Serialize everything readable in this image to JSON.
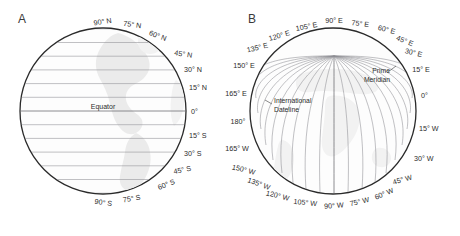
{
  "figure": {
    "panel_a_letter": "A",
    "panel_b_letter": "B",
    "background_color": "#ffffff",
    "outline_color": "#2a2a2a",
    "grid_color": "#8e8e93",
    "land_color": "#ebebeb",
    "text_color": "#2b2b2b"
  },
  "panel_a": {
    "title_letter": "A",
    "description": "Globe showing lines of latitude (parallels)",
    "equator_label": "Equator",
    "center": {
      "x": 103,
      "y": 111
    },
    "radius": 83,
    "latitude_labels": [
      {
        "text": "90° N",
        "value": 90,
        "hemisphere": "N"
      },
      {
        "text": "75° N",
        "value": 75,
        "hemisphere": "N"
      },
      {
        "text": "60° N",
        "value": 60,
        "hemisphere": "N"
      },
      {
        "text": "45° N",
        "value": 45,
        "hemisphere": "N"
      },
      {
        "text": "30° N",
        "value": 30,
        "hemisphere": "N"
      },
      {
        "text": "15° N",
        "value": 15,
        "hemisphere": "N"
      },
      {
        "text": "0°",
        "value": 0,
        "hemisphere": ""
      },
      {
        "text": "15° S",
        "value": -15,
        "hemisphere": "S"
      },
      {
        "text": "30° S",
        "value": -30,
        "hemisphere": "S"
      },
      {
        "text": "45° S",
        "value": -45,
        "hemisphere": "S"
      },
      {
        "text": "60° S",
        "value": -60,
        "hemisphere": "S"
      },
      {
        "text": "75° S",
        "value": -75,
        "hemisphere": "S"
      },
      {
        "text": "90° S",
        "value": -90,
        "hemisphere": "S"
      }
    ]
  },
  "panel_b": {
    "title_letter": "B",
    "description": "Globe showing lines of longitude (meridians)",
    "center": {
      "x": 333,
      "y": 111
    },
    "radius": 83,
    "pole_convergence": {
      "x": 334,
      "y": 56
    },
    "annotations": [
      {
        "name": "prime-meridian",
        "line1": "Prime",
        "line2": "Meridian"
      },
      {
        "name": "international-dateline",
        "line1": "International",
        "line2": "Dateline"
      }
    ],
    "longitude_labels": [
      {
        "text": "90° E",
        "value": 90,
        "hemisphere": "E"
      },
      {
        "text": "75° E",
        "value": 75,
        "hemisphere": "E"
      },
      {
        "text": "60° E",
        "value": 60,
        "hemisphere": "E"
      },
      {
        "text": "45° E",
        "value": 45,
        "hemisphere": "E"
      },
      {
        "text": "30° E",
        "value": 30,
        "hemisphere": "E"
      },
      {
        "text": "15° E",
        "value": 15,
        "hemisphere": "E"
      },
      {
        "text": "0°",
        "value": 0,
        "hemisphere": ""
      },
      {
        "text": "15° W",
        "value": -15,
        "hemisphere": "W"
      },
      {
        "text": "30° W",
        "value": -30,
        "hemisphere": "W"
      },
      {
        "text": "45° W",
        "value": -45,
        "hemisphere": "W"
      },
      {
        "text": "60° W",
        "value": -60,
        "hemisphere": "W"
      },
      {
        "text": "75° W",
        "value": -75,
        "hemisphere": "W"
      },
      {
        "text": "90° W",
        "value": -90,
        "hemisphere": "W"
      },
      {
        "text": "105° W",
        "value": -105,
        "hemisphere": "W"
      },
      {
        "text": "120° W",
        "value": -120,
        "hemisphere": "W"
      },
      {
        "text": "135° W",
        "value": -135,
        "hemisphere": "W"
      },
      {
        "text": "150° W",
        "value": -150,
        "hemisphere": "W"
      },
      {
        "text": "165° W",
        "value": -165,
        "hemisphere": "W"
      },
      {
        "text": "180°",
        "value": 180,
        "hemisphere": ""
      },
      {
        "text": "165° E",
        "value": 165,
        "hemisphere": "E"
      },
      {
        "text": "150° E",
        "value": 150,
        "hemisphere": "E"
      },
      {
        "text": "135° E",
        "value": 135,
        "hemisphere": "E"
      },
      {
        "text": "120° E",
        "value": 120,
        "hemisphere": "E"
      },
      {
        "text": "105° E",
        "value": 105,
        "hemisphere": "E"
      }
    ]
  }
}
